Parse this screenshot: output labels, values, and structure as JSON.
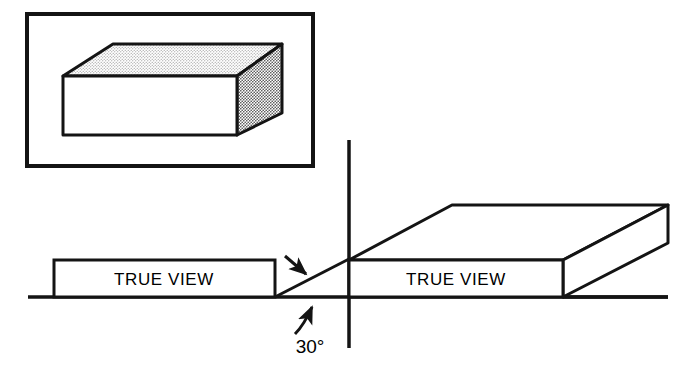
{
  "diagram": {
    "colors": {
      "ink": "#141414",
      "paper": "#ffffff",
      "stipple": "#9a9a9a",
      "stipple_dark": "#6f6f6f"
    },
    "pictorial_frame": {
      "name": "pictorial-view-frame",
      "x": 27,
      "y": 14,
      "width": 286,
      "height": 152,
      "stroke_width": 4
    },
    "pictorial_solid": {
      "name": "rectangular-prism",
      "front_face": {
        "x": 63,
        "y": 76,
        "width": 174,
        "height": 59,
        "fill": "#ffffff"
      },
      "top_face_points": "63,76 113,44 282,44 237,76",
      "right_face_points": "237,76 282,44 282,113 237,135",
      "top_face_fill": "stipple",
      "right_face_fill": "stipple_dark",
      "stroke_width": 3
    },
    "ground_line": {
      "name": "ground-reference-line",
      "x1": 28,
      "y1": 297,
      "x2": 668,
      "y2": 297,
      "stroke_width": 3.5
    },
    "vertical_axis": {
      "name": "vertical-axis-line",
      "x1": 349,
      "y1": 140,
      "x2": 349,
      "y2": 348,
      "stroke_width": 3.5
    },
    "left_view": {
      "name": "left-true-view-rectangle",
      "x": 54,
      "y": 260,
      "width": 221,
      "height": 37,
      "label": "TRUE VIEW",
      "label_x": 164,
      "label_y": 285,
      "label_size": 17,
      "stroke_width": 3
    },
    "receding_axis": {
      "name": "thirty-degree-receding-axis",
      "x1": 275,
      "y1": 297,
      "x2": 349,
      "y2": 259,
      "stroke_width": 3,
      "angle_label": "30°",
      "angle_label_x": 310,
      "angle_label_y": 352,
      "angle_label_size": 19
    },
    "pointer_arrow_axis": {
      "name": "axis-pointer-arrow",
      "x1": 285,
      "y1": 256,
      "x2": 307,
      "y2": 275
    },
    "pointer_arrow_angle": {
      "name": "angle-pointer-arrow",
      "x1": 296,
      "y1": 333,
      "x2": 313,
      "y2": 305
    },
    "right_solid": {
      "name": "oblique-projection-solid",
      "front_face": {
        "x": 349,
        "y": 260,
        "width": 214,
        "height": 37,
        "fill": "#ffffff"
      },
      "top_face_points": "349,260 452,205 668,205 563,260",
      "right_face_points": "563,260 668,205 668,243 563,297",
      "label": "TRUE VIEW",
      "label_x": 456,
      "label_y": 285,
      "label_size": 17,
      "stroke_width": 3
    }
  }
}
